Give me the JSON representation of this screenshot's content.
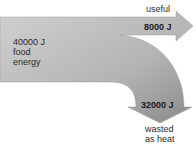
{
  "diagram": {
    "type": "sankey",
    "colors": {
      "band_light": "#d2d2d2",
      "band_dark": "#8a8a8a",
      "text": "#2a2a2a"
    },
    "input": {
      "value": "40000 J",
      "line2": "food",
      "line3": "energy"
    },
    "outputs": [
      {
        "name": "useful",
        "value": "8000 J"
      },
      {
        "name_line1": "wasted",
        "name_line2": "as heat",
        "value": "32000 J"
      }
    ]
  }
}
